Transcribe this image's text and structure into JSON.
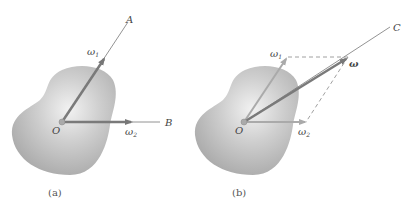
{
  "figure_a": {
    "caption": "(a)",
    "origin_label": "O",
    "axis_a_label": "A",
    "axis_b_label": "B",
    "omega1_label": "ω",
    "omega1_sub": "1",
    "omega2_label": "ω",
    "omega2_sub": "2"
  },
  "figure_b": {
    "caption": "(b)",
    "origin_label": "O",
    "axis_c_label": "C",
    "omega1_label": "ω",
    "omega1_sub": "1",
    "omega2_label": "ω",
    "omega2_sub": "2",
    "omega_label": "ω"
  },
  "colors": {
    "arrow_dark": "#7a7a7a",
    "arrow_light": "#a8a8a8",
    "body_fill": "#bdbdbd",
    "axis_line": "#666666"
  }
}
